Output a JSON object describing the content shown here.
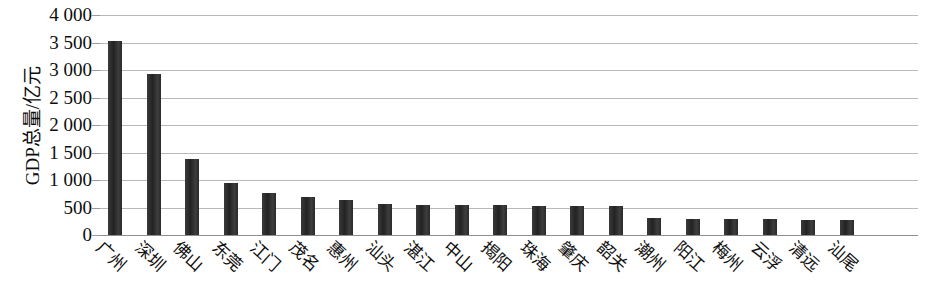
{
  "chart_data": {
    "type": "bar",
    "title": "",
    "xlabel": "",
    "ylabel": "GDP总量/亿元",
    "ylim": [
      0,
      4000
    ],
    "ytick_labels": [
      "4 000",
      "3 500",
      "3 000",
      "2 500",
      "2 000",
      "1 500",
      "1 000",
      "500",
      "0"
    ],
    "ytick_values": [
      4000,
      3500,
      3000,
      2500,
      2000,
      1500,
      1000,
      500,
      0
    ],
    "grid": true,
    "legend": "none",
    "bar_color": "#2e2e2e",
    "grid_color": "#b9b9b9",
    "categories": [
      "广州",
      "深圳",
      "佛山",
      "东莞",
      "江门",
      "茂名",
      "惠州",
      "汕头",
      "湛江",
      "中山",
      "揭阳",
      "珠海",
      "肇庆",
      "韶关",
      "潮州",
      "阳江",
      "梅州",
      "云浮",
      "清远",
      "汕尾"
    ],
    "values": [
      3520,
      2920,
      1380,
      950,
      760,
      690,
      640,
      560,
      550,
      545,
      540,
      535,
      530,
      520,
      310,
      300,
      295,
      285,
      280,
      275
    ],
    "series": [
      {
        "name": "GDP总量",
        "values": [
          3520,
          2920,
          1380,
          950,
          760,
          690,
          640,
          560,
          550,
          545,
          540,
          535,
          530,
          520,
          310,
          300,
          295,
          285,
          280,
          275
        ]
      }
    ],
    "points": [
      {
        "category": "广州",
        "value": 3520
      },
      {
        "category": "深圳",
        "value": 2920
      },
      {
        "category": "佛山",
        "value": 1380
      },
      {
        "category": "东莞",
        "value": 950
      },
      {
        "category": "江门",
        "value": 760
      },
      {
        "category": "茂名",
        "value": 690
      },
      {
        "category": "惠州",
        "value": 640
      },
      {
        "category": "汕头",
        "value": 560
      },
      {
        "category": "湛江",
        "value": 550
      },
      {
        "category": "中山",
        "value": 545
      },
      {
        "category": "揭阳",
        "value": 540
      },
      {
        "category": "珠海",
        "value": 535
      },
      {
        "category": "肇庆",
        "value": 530
      },
      {
        "category": "韶关",
        "value": 520
      },
      {
        "category": "潮州",
        "value": 310
      },
      {
        "category": "阳江",
        "value": 300
      },
      {
        "category": "梅州",
        "value": 295
      },
      {
        "category": "云浮",
        "value": 285
      },
      {
        "category": "清远",
        "value": 280
      },
      {
        "category": "汕尾",
        "value": 275
      }
    ]
  }
}
